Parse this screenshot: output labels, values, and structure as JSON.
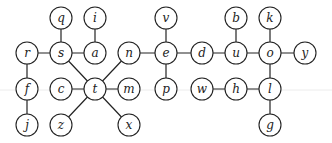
{
  "graph": {
    "node_radius": 11,
    "nodes": [
      {
        "id": "q",
        "label": "q",
        "x": 61,
        "y": 18
      },
      {
        "id": "i",
        "label": "i",
        "x": 95,
        "y": 18
      },
      {
        "id": "v",
        "label": "v",
        "x": 166,
        "y": 18
      },
      {
        "id": "b",
        "label": "b",
        "x": 236,
        "y": 18
      },
      {
        "id": "k",
        "label": "k",
        "x": 270,
        "y": 18
      },
      {
        "id": "r",
        "label": "r",
        "x": 27,
        "y": 53
      },
      {
        "id": "s",
        "label": "s",
        "x": 61,
        "y": 53
      },
      {
        "id": "a",
        "label": "a",
        "x": 95,
        "y": 53
      },
      {
        "id": "n",
        "label": "n",
        "x": 129,
        "y": 53
      },
      {
        "id": "e",
        "label": "e",
        "x": 166,
        "y": 53
      },
      {
        "id": "d",
        "label": "d",
        "x": 202,
        "y": 53
      },
      {
        "id": "u",
        "label": "u",
        "x": 236,
        "y": 53
      },
      {
        "id": "o",
        "label": "o",
        "x": 270,
        "y": 53
      },
      {
        "id": "y",
        "label": "y",
        "x": 305,
        "y": 53
      },
      {
        "id": "f",
        "label": "f",
        "x": 27,
        "y": 89
      },
      {
        "id": "c",
        "label": "c",
        "x": 61,
        "y": 89
      },
      {
        "id": "t",
        "label": "t",
        "x": 95,
        "y": 89
      },
      {
        "id": "m",
        "label": "m",
        "x": 129,
        "y": 89
      },
      {
        "id": "p",
        "label": "p",
        "x": 166,
        "y": 89
      },
      {
        "id": "w",
        "label": "w",
        "x": 202,
        "y": 89
      },
      {
        "id": "h",
        "label": "h",
        "x": 236,
        "y": 89
      },
      {
        "id": "l",
        "label": "l",
        "x": 270,
        "y": 89
      },
      {
        "id": "j",
        "label": "j",
        "x": 27,
        "y": 125
      },
      {
        "id": "z",
        "label": "z",
        "x": 61,
        "y": 125
      },
      {
        "id": "x",
        "label": "x",
        "x": 129,
        "y": 125
      },
      {
        "id": "g",
        "label": "g",
        "x": 270,
        "y": 125
      }
    ],
    "edges": [
      [
        "q",
        "s"
      ],
      [
        "i",
        "a"
      ],
      [
        "r",
        "s"
      ],
      [
        "s",
        "a"
      ],
      [
        "r",
        "f"
      ],
      [
        "f",
        "j"
      ],
      [
        "s",
        "t"
      ],
      [
        "n",
        "t"
      ],
      [
        "c",
        "t"
      ],
      [
        "t",
        "m"
      ],
      [
        "t",
        "z"
      ],
      [
        "t",
        "x"
      ],
      [
        "n",
        "e"
      ],
      [
        "v",
        "e"
      ],
      [
        "e",
        "p"
      ],
      [
        "e",
        "d"
      ],
      [
        "d",
        "u"
      ],
      [
        "b",
        "u"
      ],
      [
        "u",
        "o"
      ],
      [
        "k",
        "o"
      ],
      [
        "o",
        "y"
      ],
      [
        "o",
        "l"
      ],
      [
        "w",
        "h"
      ],
      [
        "h",
        "l"
      ],
      [
        "l",
        "g"
      ]
    ]
  }
}
